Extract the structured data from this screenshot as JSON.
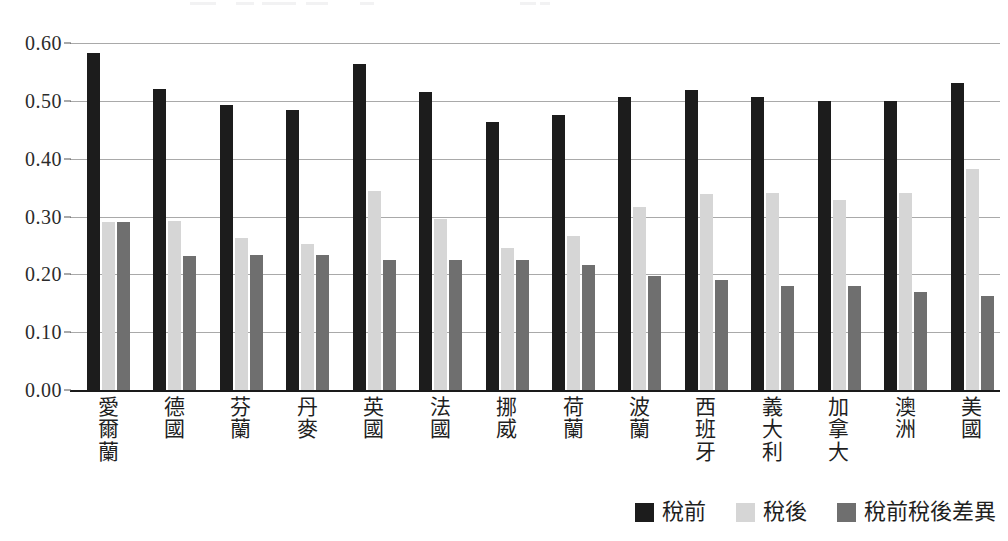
{
  "chart_data": {
    "type": "bar",
    "title": "",
    "subtitle": "",
    "xlabel": "",
    "ylabel": "",
    "ylim": [
      0.0,
      0.6
    ],
    "ytick_labels": [
      "0.60",
      "0.50",
      "0.40",
      "0.30",
      "0.20",
      "0.10",
      "0.00"
    ],
    "ytick_values": [
      0.6,
      0.5,
      0.4,
      0.3,
      0.2,
      0.1,
      0.0
    ],
    "grid": true,
    "legend_position": "bottom-right",
    "categories": [
      "愛爾蘭",
      "德國",
      "芬蘭",
      "丹麥",
      "英國",
      "法國",
      "挪威",
      "荷蘭",
      "波蘭",
      "西班牙",
      "義大利",
      "加拿大",
      "澳洲",
      "美國"
    ],
    "series": [
      {
        "name": "稅前",
        "color": "#1c1c1c",
        "values": [
          0.582,
          0.52,
          0.493,
          0.485,
          0.563,
          0.515,
          0.464,
          0.475,
          0.506,
          0.518,
          0.507,
          0.5,
          0.5,
          0.53
        ]
      },
      {
        "name": "稅後",
        "color": "#d6d6d6",
        "values": [
          0.291,
          0.292,
          0.262,
          0.252,
          0.344,
          0.295,
          0.245,
          0.266,
          0.317,
          0.339,
          0.34,
          0.329,
          0.341,
          0.382
        ]
      },
      {
        "name": "稅前稅後差異",
        "color": "#6f6f6f",
        "values": [
          0.291,
          0.232,
          0.233,
          0.234,
          0.224,
          0.224,
          0.225,
          0.217,
          0.198,
          0.19,
          0.179,
          0.179,
          0.17,
          0.162
        ]
      }
    ]
  },
  "legend": {
    "items": [
      {
        "label": "稅前",
        "color": "#1c1c1c"
      },
      {
        "label": "稅後",
        "color": "#d6d6d6"
      },
      {
        "label": "稅前稅後差異",
        "color": "#6f6f6f"
      }
    ]
  },
  "colors": {
    "before_tax": "#1c1c1c",
    "after_tax": "#d6d6d6",
    "difference": "#6f6f6f",
    "gridline": "#a9a9a9",
    "axis": "#1a1a1a",
    "text": "#1f1f1f",
    "background": "#ffffff"
  }
}
